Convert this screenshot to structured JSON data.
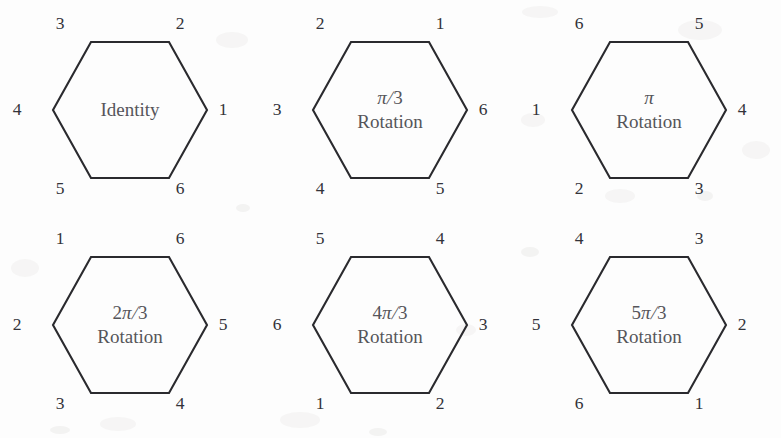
{
  "figure": {
    "background_color": "#fdfdfd",
    "stroke_color": "#2a2a2e",
    "label_color": "#33333a",
    "caption_color": "#55555a",
    "columns": 3,
    "rows": 2,
    "shape": "hexagon"
  },
  "hexagons": [
    {
      "id": "identity",
      "caption_line1": "Identity",
      "caption_line2": "",
      "vertices": {
        "top_left": "3",
        "top_right": "2",
        "right": "1",
        "bottom_right": "6",
        "bottom_left": "5",
        "left": "4"
      }
    },
    {
      "id": "pi-over-3-rotation",
      "caption_line1": "π/3",
      "caption_line2": "Rotation",
      "vertices": {
        "top_left": "2",
        "top_right": "1",
        "right": "6",
        "bottom_right": "5",
        "bottom_left": "4",
        "left": "3"
      }
    },
    {
      "id": "pi-rotation",
      "caption_line1": "π",
      "caption_line2": "Rotation",
      "vertices": {
        "top_left": "6",
        "top_right": "5",
        "right": "4",
        "bottom_right": "3",
        "bottom_left": "2",
        "left": "1"
      }
    },
    {
      "id": "two-pi-over-3-rotation",
      "caption_line1": "2π/3",
      "caption_line2": "Rotation",
      "vertices": {
        "top_left": "1",
        "top_right": "6",
        "right": "5",
        "bottom_right": "4",
        "bottom_left": "3",
        "left": "2"
      }
    },
    {
      "id": "four-pi-over-3-rotation",
      "caption_line1": "4π/3",
      "caption_line2": "Rotation",
      "vertices": {
        "top_left": "5",
        "top_right": "4",
        "right": "3",
        "bottom_right": "2",
        "bottom_left": "1",
        "left": "6"
      }
    },
    {
      "id": "five-pi-over-3-rotation",
      "caption_line1": "5π/3",
      "caption_line2": "Rotation",
      "vertices": {
        "top_left": "4",
        "top_right": "3",
        "right": "2",
        "bottom_right": "1",
        "bottom_left": "6",
        "left": "5"
      }
    }
  ]
}
